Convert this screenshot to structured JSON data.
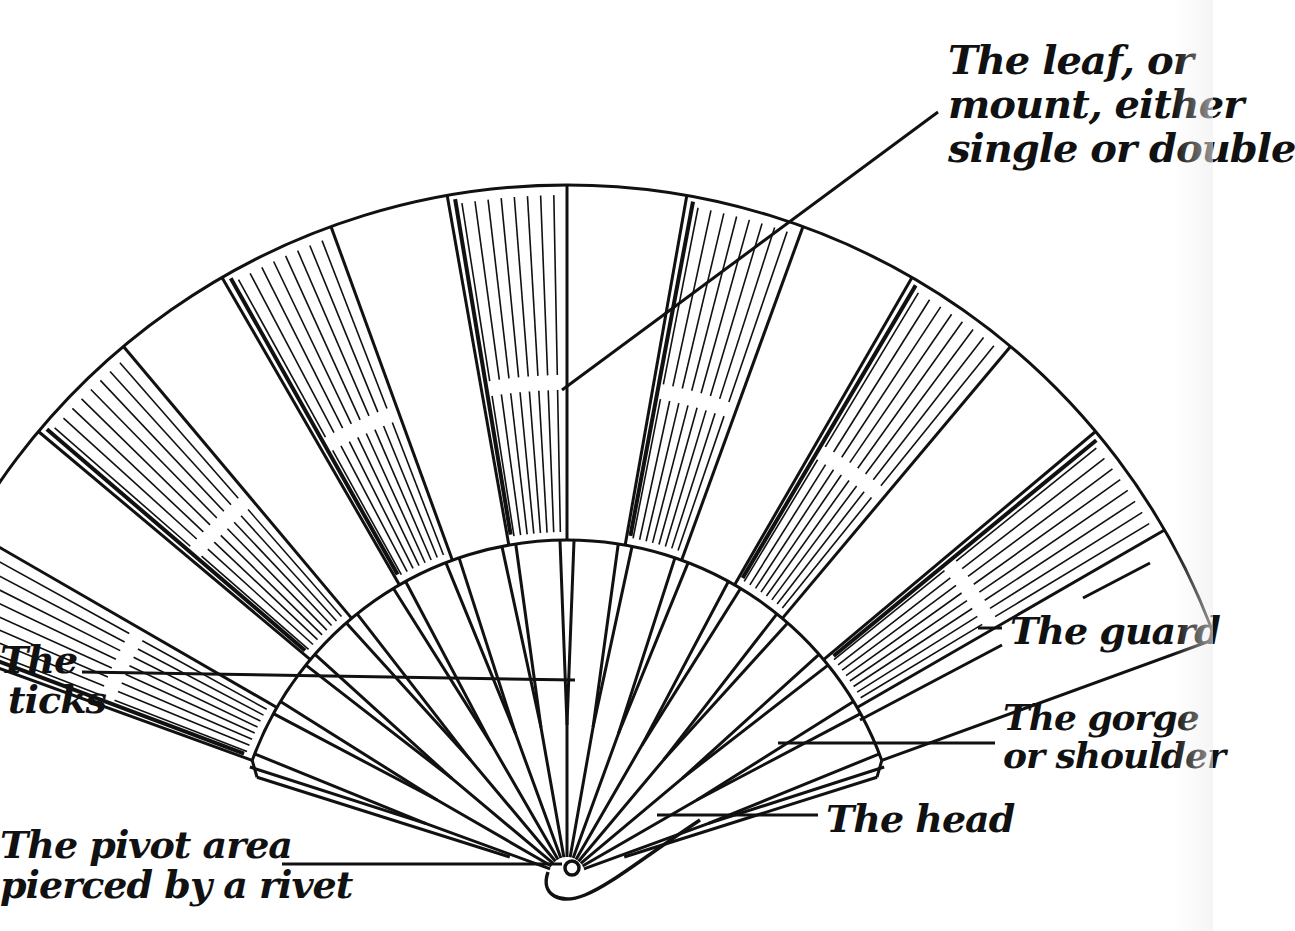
{
  "diagram": {
    "colors": {
      "ink": "#111111",
      "paper": "#ffffff"
    },
    "labels": {
      "leaf": [
        "The leaf, or",
        "mount, either",
        "single or double"
      ],
      "sticks": [
        "The",
        "ticks"
      ],
      "guard": "The guard",
      "gorge": [
        "The gorge",
        "or shoulder"
      ],
      "head": "The head",
      "pivot": [
        "The pivot area",
        "pierced by a rivet"
      ]
    }
  }
}
